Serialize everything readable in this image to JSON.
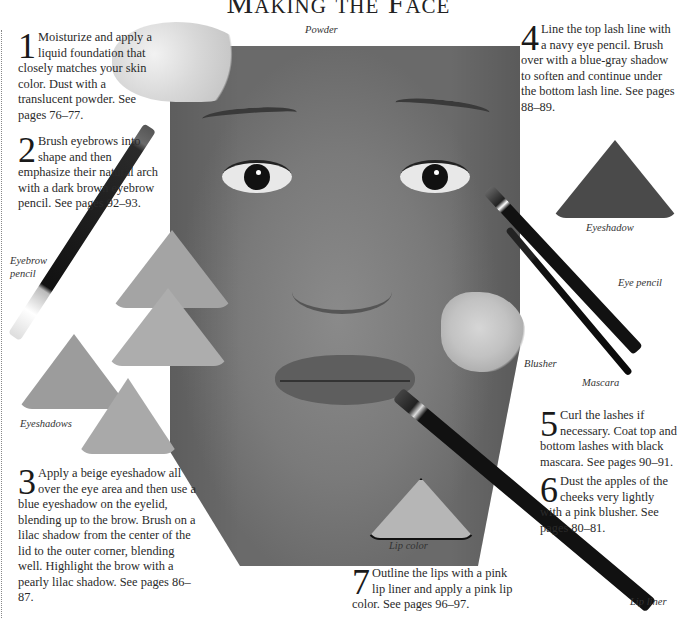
{
  "page": {
    "title": "Making the Face"
  },
  "steps": [
    {
      "number": "1",
      "text": "Moisturize and apply a liquid foundation that closely matches your skin color. Dust with a translucent powder. See pages 76–77."
    },
    {
      "number": "2",
      "text": "Brush eyebrows into shape and then emphasize their natural arch with a dark brown eyebrow pencil. See pages 92–93."
    },
    {
      "number": "3",
      "text": "Apply a beige eyeshadow all over the eye area and then use a blue eyeshadow on the eyelid, blending up to the brow. Brush on a lilac shadow from the center of the lid to the outer corner, blending well. Highlight the brow with a pearly lilac shadow. See pages 86–87."
    },
    {
      "number": "4",
      "text": "Line the top lash line with a navy eye pencil. Brush over with a blue-gray shadow to soften and continue under the bottom lash line. See pages 88–89."
    },
    {
      "number": "5",
      "text": "Curl the lashes if necessary. Coat top and bottom lashes with black mascara. See pages 90–91."
    },
    {
      "number": "6",
      "text": "Dust the apples of the cheeks very lightly with a pink blusher. See pages 80–81."
    },
    {
      "number": "7",
      "text": "Outline the lips with a pink lip liner and apply a pink lip color. See pages 96–97."
    }
  ],
  "captions": {
    "powder": "Powder",
    "eyebrow_pencil": "Eyebrow pencil",
    "eyeshadows": "Eyeshadows",
    "eyeshadow": "Eyeshadow",
    "eye_pencil": "Eye pencil",
    "blusher": "Blusher",
    "mascara": "Mascara",
    "lip_color": "Lip color",
    "lip_liner": "Lip liner"
  },
  "colors": {
    "text": "#222222",
    "paper": "#ffffff",
    "photo_gray": "#7a7a7a",
    "dark_eyeshadow": "#4a4a4a",
    "light_eyeshadow": "#a8a8a8",
    "pencil_black": "#111111"
  }
}
